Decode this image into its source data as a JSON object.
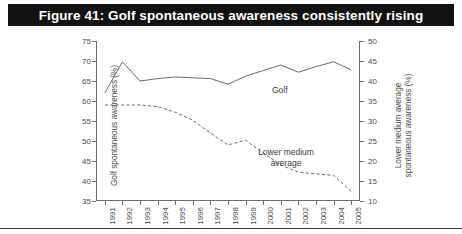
{
  "figure": {
    "title": "Figure 41: Golf spontaneous awareness consistently rising",
    "title_bar_color": "#121212",
    "title_text_color": "#ffffff",
    "background_color": "#ffffff"
  },
  "chart_data": {
    "type": "line",
    "title": "Figure 41: Golf spontaneous awareness consistently rising",
    "xlabel": "",
    "categories": [
      "1991",
      "1992",
      "1993",
      "1994",
      "1995",
      "1996",
      "1997",
      "1998",
      "1999",
      "2000",
      "2001",
      "2002",
      "2003",
      "2004",
      "2005"
    ],
    "grid": false,
    "legend_position": "inline-annotation",
    "axes": {
      "left": {
        "label": "Golf spontaneous awareness (%)",
        "ticks": [
          35,
          40,
          45,
          50,
          55,
          60,
          65,
          70,
          75
        ],
        "ylim": [
          35,
          75
        ]
      },
      "right": {
        "label": "Lower medium average spontaneous awareness (%)",
        "label_line1": "Lower medium average",
        "label_line2": "spontaneous awareness (%)",
        "ticks": [
          10,
          15,
          20,
          25,
          30,
          35,
          40,
          45,
          50
        ],
        "ylim": [
          10,
          50
        ]
      }
    },
    "series": [
      {
        "name": "Golf",
        "axis": "left",
        "style": "solid",
        "color": "#5a5a5a",
        "annotation": "Golf",
        "values": [
          62.0,
          69.8,
          65.0,
          65.6,
          66.0,
          65.8,
          65.6,
          64.2,
          66.2,
          67.6,
          69.0,
          67.2,
          68.6,
          69.8,
          67.8
        ]
      },
      {
        "name": "Lower medium average",
        "axis": "right",
        "style": "dashed",
        "color": "#5a5a5a",
        "annotation": "Lower medium average",
        "values": [
          34.0,
          34.0,
          34.0,
          33.6,
          32.2,
          30.2,
          27.0,
          24.0,
          25.2,
          22.0,
          19.0,
          17.2,
          16.8,
          16.4,
          12.4
        ]
      }
    ]
  }
}
